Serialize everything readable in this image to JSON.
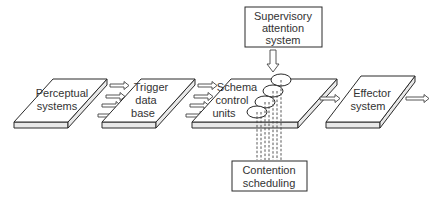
{
  "diagram": {
    "nodes": {
      "perceptual": {
        "lines": [
          "Perceptual",
          "systems"
        ]
      },
      "trigger": {
        "lines": [
          "Trigger",
          "data",
          "base"
        ]
      },
      "schema": {
        "lines": [
          "Schema",
          "control",
          "units"
        ]
      },
      "effector": {
        "lines": [
          "Effector",
          "system"
        ]
      },
      "supervisory": {
        "lines": [
          "Supervisory",
          "attention",
          "system"
        ]
      },
      "contention": {
        "lines": [
          "Contention",
          "scheduling"
        ]
      }
    },
    "edges": [
      {
        "from": "perceptual",
        "to": "trigger",
        "count": 4
      },
      {
        "from": "trigger",
        "to": "schema",
        "count": 4
      },
      {
        "from": "schema",
        "to": "effector",
        "count": 1
      },
      {
        "from": "effector",
        "to": "output",
        "count": 1
      },
      {
        "from": "supervisory",
        "to": "schema",
        "count": 1
      },
      {
        "from": "contention",
        "to": "schema",
        "style": "dashed",
        "count": 4
      }
    ],
    "schema_units_count": 4
  }
}
